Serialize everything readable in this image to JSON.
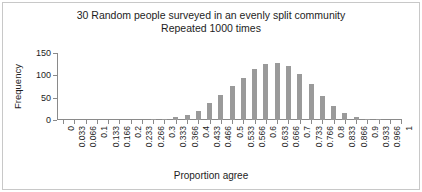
{
  "chart_data": {
    "type": "bar",
    "title_line1": "30 Random people surveyed in an evenly split community",
    "title_line2": "Repeated 1000 times",
    "xlabel": "Proportion agree",
    "ylabel": "Frequency",
    "ylim": [
      0,
      150
    ],
    "yticks": [
      0,
      50,
      100,
      150
    ],
    "ytick_labels": [
      "0",
      "50",
      "100",
      "150"
    ],
    "grid": false,
    "legend": null,
    "bar_color": "#9a9a9a",
    "axis_color": "#8a8a8a",
    "categories": [
      "0",
      "0.033",
      "0.066",
      "0.1",
      "0.133",
      "0.166",
      "0.2",
      "0.233",
      "0.266",
      "0.3",
      "0.333",
      "0.366",
      "0.4",
      "0.433",
      "0.466",
      "0.5",
      "0.533",
      "0.566",
      "0.6",
      "0.633",
      "0.666",
      "0.7",
      "0.733",
      "0.766",
      "0.8",
      "0.833",
      "0.866",
      "0.9",
      "0.933",
      "0.966",
      "1"
    ],
    "values": [
      0,
      0,
      0,
      0,
      0,
      0,
      0,
      0,
      1,
      2,
      6,
      11,
      21,
      38,
      57,
      77,
      94,
      114,
      125,
      127,
      121,
      102,
      80,
      54,
      31,
      16,
      7,
      3,
      1,
      0,
      0
    ],
    "values_note": "Frequency counts out of 1000 repetitions; sampling distribution of the sample proportion for n=30, p=0.5"
  }
}
